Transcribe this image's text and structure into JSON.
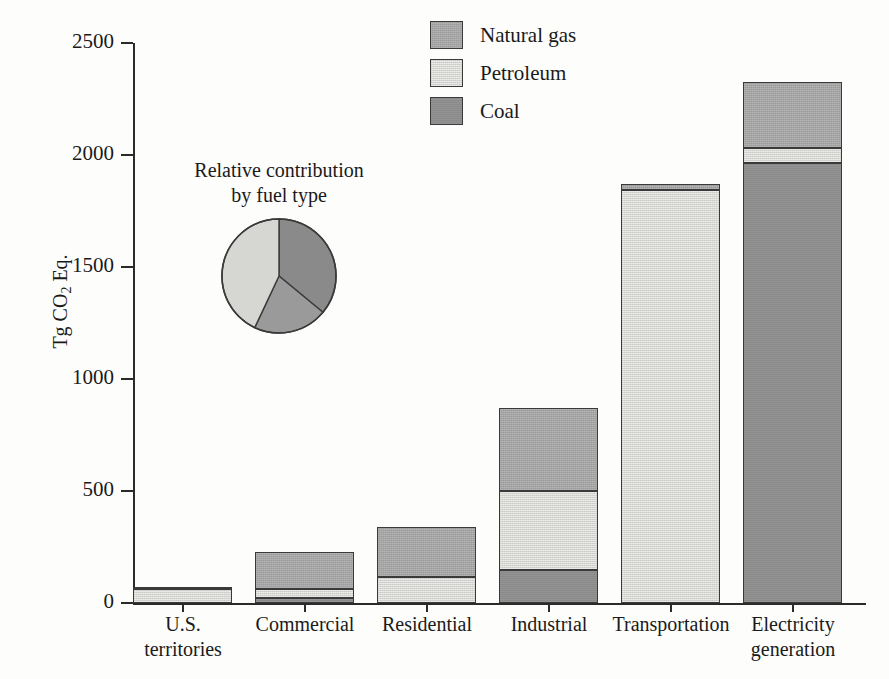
{
  "chart_data": {
    "type": "bar",
    "subtype": "stacked-bar-with-inset-pie",
    "title": "",
    "xlabel": "",
    "ylabel": "Tg CO2 Eq.",
    "ylabel_rich": {
      "pre": "Tg CO",
      "sub": "2",
      "post": " Eq."
    },
    "ylim": [
      0,
      2500
    ],
    "yticks": [
      0,
      500,
      1000,
      1500,
      2000,
      2500
    ],
    "ytick_labels": [
      "0",
      "500",
      "1000",
      "1500",
      "2000",
      "2500"
    ],
    "grid": false,
    "legend_position": "top-center",
    "stack_order_bottom_to_top": [
      "Coal",
      "Petroleum",
      "Natural gas"
    ],
    "categories": [
      "U.S. territories",
      "Commercial",
      "Residential",
      "Industrial",
      "Transportation",
      "Electricity generation"
    ],
    "category_lines": [
      [
        "U.S.",
        "territories"
      ],
      [
        "Commercial"
      ],
      [
        "Residential"
      ],
      [
        "Industrial"
      ],
      [
        "Transportation"
      ],
      [
        "Electricity",
        "generation"
      ]
    ],
    "series": [
      {
        "name": "Natural gas",
        "color": "#9a9a9a",
        "values": [
          9,
          165,
          223,
          370,
          27,
          294
        ]
      },
      {
        "name": "Petroleum",
        "color": "#d6d6d2",
        "values": [
          62,
          40,
          116,
          352,
          1845,
          67
        ]
      },
      {
        "name": "Coal",
        "color": "#8a8a8a",
        "values": [
          0,
          22,
          0,
          147,
          0,
          1965
        ]
      }
    ],
    "totals": [
      71,
      227,
      339,
      869,
      1872,
      2326
    ]
  },
  "pie_chart": {
    "type": "pie",
    "title_lines": [
      "Relative contribution",
      "by fuel type"
    ],
    "start_angle_deg": 0,
    "direction": "clockwise",
    "labels": [
      "Coal",
      "Natural gas",
      "Petroleum"
    ],
    "values": [
      36,
      21,
      43
    ],
    "colors": [
      "#8a8a8a",
      "#9a9a9a",
      "#d6d6d2"
    ]
  },
  "legend": {
    "items": [
      {
        "label": "Natural gas",
        "color": "#9a9a9a",
        "swatch": "natural-gas-swatch"
      },
      {
        "label": "Petroleum",
        "color": "#d6d6d2",
        "swatch": "petroleum-swatch"
      },
      {
        "label": "Coal",
        "color": "#8a8a8a",
        "swatch": "coal-swatch"
      }
    ]
  },
  "colors": {
    "natural_gas": "#9a9a9a",
    "petroleum": "#d6d6d2",
    "coal": "#8a8a8a",
    "axis": "#2b2b2b",
    "text": "#1a1a1a",
    "background": "#fdfdfc"
  }
}
